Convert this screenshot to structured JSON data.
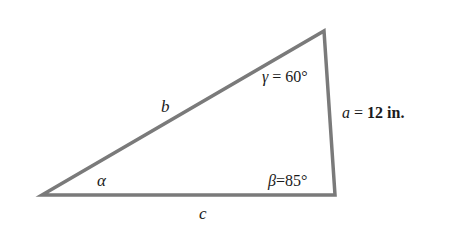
{
  "figure": {
    "type": "triangle",
    "colors": {
      "background": "#ffffff",
      "stroke": "#7a7a7a",
      "text": "#1a1a1a"
    },
    "vertices": {
      "A": {
        "x": 42,
        "y": 195
      },
      "B": {
        "x": 335,
        "y": 195
      },
      "C": {
        "x": 324,
        "y": 31
      }
    },
    "sides": {
      "a": {
        "symbol": "a",
        "equals": " = ",
        "value": "12 in."
      },
      "b": {
        "symbol": "b"
      },
      "c": {
        "symbol": "c"
      }
    },
    "angles": {
      "alpha": {
        "symbol": "α"
      },
      "beta": {
        "symbol": "β",
        "equals": "=",
        "value": "85°"
      },
      "gamma": {
        "symbol": "γ",
        "equals": " = ",
        "value": "60°"
      }
    }
  }
}
